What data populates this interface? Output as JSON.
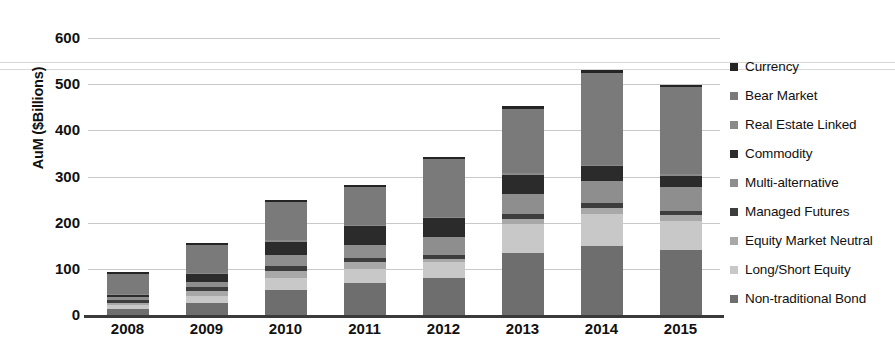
{
  "chart_data": {
    "type": "bar",
    "subtype": "stacked-bar",
    "title": "",
    "xlabel": "",
    "ylabel": "AuM ($Billions)",
    "ylim": [
      0,
      600
    ],
    "ytick_values": [
      0,
      100,
      200,
      300,
      400,
      500,
      600
    ],
    "ytick_labels": [
      "0",
      "100",
      "200",
      "300",
      "400",
      "500",
      "600"
    ],
    "grid": true,
    "legend_position": "right",
    "categories": [
      "2008",
      "2009",
      "2010",
      "2011",
      "2012",
      "2013",
      "2014",
      "2015"
    ],
    "series": [
      {
        "name": "Non-traditional Bond",
        "color": "#6e6e6e",
        "values": [
          14,
          25,
          55,
          70,
          80,
          135,
          150,
          140
        ]
      },
      {
        "name": "Long/Short Equity",
        "color": "#c8c8c8",
        "values": [
          8,
          16,
          26,
          30,
          34,
          62,
          68,
          64
        ]
      },
      {
        "name": "Equity Market Neutral",
        "color": "#a8a8a8",
        "values": [
          5,
          10,
          14,
          14,
          8,
          12,
          14,
          12
        ]
      },
      {
        "name": "Managed Futures",
        "color": "#3d3d3d",
        "values": [
          6,
          10,
          12,
          10,
          8,
          10,
          10,
          10
        ]
      },
      {
        "name": "Multi-alternative",
        "color": "#8e8e8e",
        "values": [
          6,
          10,
          22,
          28,
          38,
          44,
          48,
          52
        ]
      },
      {
        "name": "Commodity",
        "color": "#2b2b2b",
        "values": [
          5,
          18,
          30,
          40,
          42,
          40,
          32,
          24
        ]
      },
      {
        "name": "Real Estate Linked",
        "color": "#8a8a8a",
        "values": [
          2,
          2,
          3,
          3,
          3,
          4,
          4,
          4
        ]
      },
      {
        "name": "Bear Market",
        "color": "#7a7a7a",
        "values": [
          44,
          60,
          83,
          82,
          125,
          140,
          198,
          188
        ]
      },
      {
        "name": "Currency",
        "color": "#242424",
        "values": [
          4,
          5,
          5,
          5,
          5,
          6,
          6,
          5
        ]
      }
    ],
    "totals": [
      94,
      156,
      250,
      282,
      343,
      453,
      530,
      499
    ]
  },
  "axes": {
    "y_title": "AuM ($Billions)",
    "y_ticks": [
      "600",
      "500",
      "400",
      "300",
      "200",
      "100",
      "0"
    ],
    "x_ticks": [
      "2008",
      "2009",
      "2010",
      "2011",
      "2012",
      "2013",
      "2014",
      "2015"
    ]
  },
  "legend": {
    "items": [
      {
        "label": "Currency",
        "color": "#242424"
      },
      {
        "label": "Bear Market",
        "color": "#7a7a7a"
      },
      {
        "label": "Real Estate Linked",
        "color": "#8a8a8a"
      },
      {
        "label": "Commodity",
        "color": "#2b2b2b"
      },
      {
        "label": "Multi-alternative",
        "color": "#8e8e8e"
      },
      {
        "label": "Managed Futures",
        "color": "#3d3d3d"
      },
      {
        "label": "Equity Market Neutral",
        "color": "#a8a8a8"
      },
      {
        "label": "Long/Short Equity",
        "color": "#c8c8c8"
      },
      {
        "label": "Non-traditional Bond",
        "color": "#6e6e6e"
      }
    ]
  }
}
